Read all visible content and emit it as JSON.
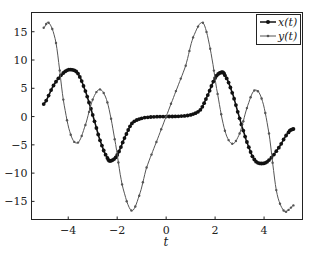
{
  "chart_data": {
    "type": "line",
    "title": "",
    "xlabel": "t",
    "ylabel": "",
    "xlim": [
      -5.5,
      5.57
    ],
    "ylim": [
      -18.2,
      18.4
    ],
    "xticks": [
      -4,
      -2,
      0,
      2,
      4
    ],
    "xtick_labels": [
      "−4",
      "−2",
      "0",
      "2",
      "4"
    ],
    "yticks": [
      -15,
      -10,
      -5,
      0,
      5,
      10,
      15
    ],
    "ytick_labels": [
      "−15",
      "−10",
      "−5",
      "0",
      "5",
      "10",
      "15"
    ],
    "grid": false,
    "legend_position": "top-right",
    "series": [
      {
        "name": "x(t)",
        "color": "#111111",
        "marker": "dot-large",
        "t": [
          -5.0,
          -4.6,
          -4.2,
          -3.9,
          -3.6,
          -3.3,
          -3.0,
          -2.7,
          -2.4,
          -2.25,
          -2.0,
          -1.7,
          -1.4,
          -1.0,
          -0.5,
          0,
          0.5,
          1.0,
          1.4,
          1.7,
          2.0,
          2.25,
          2.4,
          2.7,
          3.0,
          3.3,
          3.6,
          3.9,
          4.2,
          4.6,
          5.0,
          5.2
        ],
        "values": [
          2.2,
          5.5,
          7.7,
          8.3,
          7.6,
          4.5,
          0.3,
          -4.2,
          -7.3,
          -7.8,
          -6.8,
          -3.8,
          -1.2,
          -0.3,
          -0.05,
          0,
          0.05,
          0.3,
          1.2,
          3.8,
          6.8,
          7.8,
          7.3,
          4.2,
          -0.3,
          -4.5,
          -7.6,
          -8.3,
          -7.7,
          -5.5,
          -2.8,
          -2.2
        ]
      },
      {
        "name": "y(t)",
        "color": "#555555",
        "marker": "dot-small",
        "t": [
          -5.0,
          -4.8,
          -4.5,
          -4.2,
          -3.9,
          -3.6,
          -3.3,
          -3.0,
          -2.7,
          -2.4,
          -2.1,
          -1.8,
          -1.42,
          -1.1,
          -0.8,
          -0.4,
          0,
          0.4,
          0.8,
          1.1,
          1.5,
          1.8,
          2.1,
          2.4,
          2.7,
          3.0,
          3.3,
          3.6,
          3.9,
          4.2,
          4.5,
          4.8,
          5.0,
          5.2
        ],
        "values": [
          15.7,
          16.6,
          13,
          3,
          -3.2,
          -4.6,
          -1.5,
          3,
          4.8,
          2.5,
          -4,
          -12,
          -16.6,
          -14,
          -9,
          -4.5,
          0,
          4.5,
          9,
          14,
          16.6,
          12,
          4,
          -2.5,
          -4.8,
          -3,
          1.5,
          4.6,
          3.2,
          -3,
          -13,
          -16.6,
          -16.5,
          -15.7
        ]
      }
    ]
  }
}
